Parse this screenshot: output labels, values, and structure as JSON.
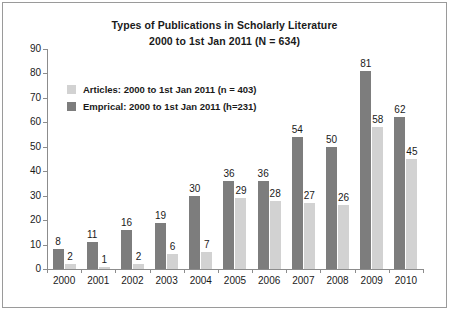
{
  "chart_data": {
    "type": "bar",
    "title": "Types of Publications in Scholarly Literature",
    "subtitle": "2000 to 1st Jan 2011 (N = 634)",
    "xlabel": "",
    "ylabel": "",
    "ylim": [
      0,
      90
    ],
    "yticks": [
      0,
      10,
      20,
      30,
      40,
      50,
      60,
      70,
      80,
      90
    ],
    "grid": false,
    "legend_position": "upper-left",
    "categories": [
      "2000",
      "2001",
      "2002",
      "2003",
      "2004",
      "2005",
      "2006",
      "2007",
      "2008",
      "2009",
      "2010"
    ],
    "series": [
      {
        "name": "Emprical: 2000 to 1st Jan 2011 (h=231)",
        "color": "#7d7d7d",
        "values": [
          8,
          11,
          16,
          19,
          30,
          36,
          36,
          54,
          50,
          81,
          62
        ]
      },
      {
        "name": "Articles: 2000 to 1st Jan 2011 (n = 403)",
        "color": "#d2d2d2",
        "values": [
          2,
          1,
          2,
          6,
          7,
          29,
          28,
          27,
          26,
          58,
          45
        ]
      }
    ]
  },
  "legend": {
    "items": [
      {
        "label": "Articles: 2000 to 1st Jan 2011 (n = 403)",
        "color": "#d2d2d2"
      },
      {
        "label": "Emprical: 2000 to 1st Jan 2011 (h=231)",
        "color": "#7d7d7d"
      }
    ]
  },
  "colors": {
    "articles": "#d2d2d2",
    "empirical": "#7d7d7d",
    "axis": "#8c8c8c",
    "border": "#9a9a9a",
    "text": "#1a1a1a"
  }
}
